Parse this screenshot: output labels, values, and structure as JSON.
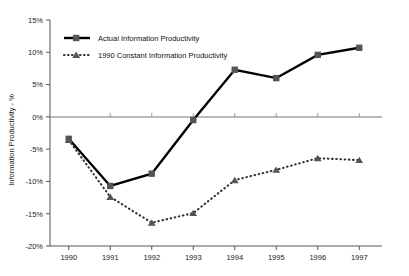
{
  "chart_data": {
    "type": "line",
    "title": "",
    "xlabel": "",
    "ylabel": "Information Productivity - %",
    "categories": [
      "1990",
      "1991",
      "1992",
      "1993",
      "1994",
      "1995",
      "1996",
      "1997"
    ],
    "ylim": [
      -20,
      15
    ],
    "ytick_labels": [
      "15%",
      "10%",
      "5%",
      "0%",
      "-5%",
      "-10%",
      "-15%",
      "-20%"
    ],
    "ytick_values": [
      15,
      10,
      5,
      0,
      -5,
      -10,
      -15,
      -20
    ],
    "grid": false,
    "legend_position": "upper-left",
    "series": [
      {
        "name": "Actual Information Productivity",
        "style": "solid",
        "marker": "square",
        "color": "#000000",
        "values": [
          -3.4,
          -10.7,
          -8.8,
          -0.5,
          7.3,
          6.0,
          9.6,
          10.7
        ]
      },
      {
        "name": "1990 Constant Information Productivity",
        "style": "dotted",
        "marker": "triangle",
        "color": "#333333",
        "values": [
          -3.6,
          -12.4,
          -16.4,
          -14.9,
          -9.8,
          -8.2,
          -6.4,
          -6.7
        ]
      }
    ]
  },
  "legend": {
    "items": [
      {
        "label": "Actual Information Productivity"
      },
      {
        "label": "1990 Constant Information Productivity"
      }
    ]
  }
}
